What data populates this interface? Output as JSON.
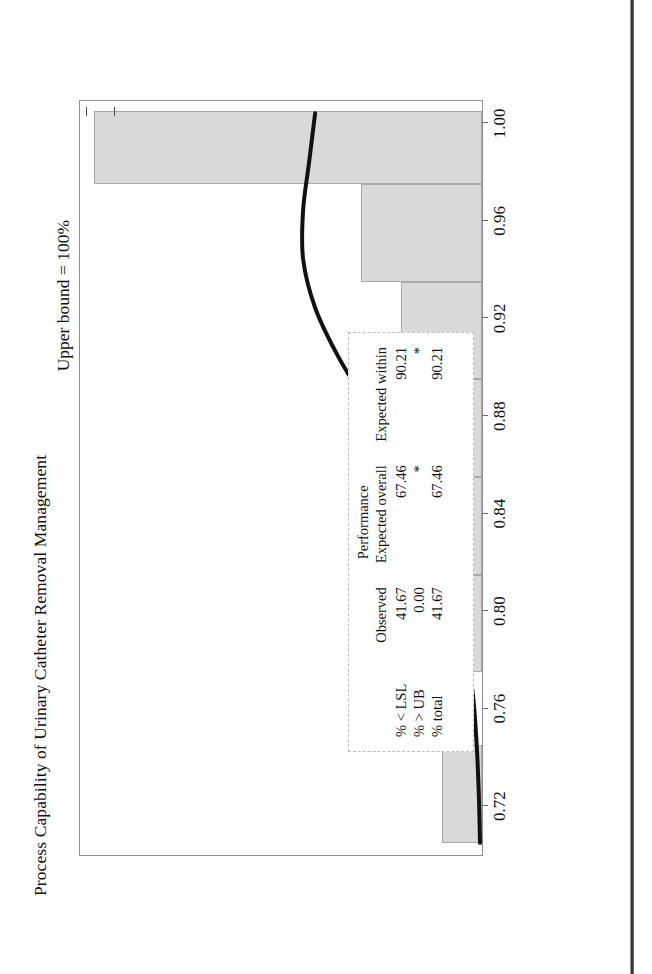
{
  "figure": {
    "title": "Process Capability of Urinary Catheter Removal Management",
    "upper_bound_label": "Upper bound = 100%",
    "lower_spec_label": "Lower spec limit = 99%"
  },
  "table": {
    "group_header": "Performance",
    "columns": [
      "",
      "Observed",
      "Expected overall",
      "Expected within"
    ],
    "rows": [
      {
        "label": "% < LSL",
        "observed": "41.67",
        "expected_overall": "67.46",
        "expected_within": "90.21"
      },
      {
        "label": "% > UB",
        "observed": "0.00",
        "expected_overall": "*",
        "expected_within": "*"
      },
      {
        "label": "% total",
        "observed": "41.67",
        "expected_overall": "67.46",
        "expected_within": "90.21"
      }
    ]
  },
  "chart_data": {
    "type": "bar",
    "title": "Process Capability of Urinary Catheter Removal Management",
    "xlabel": "",
    "ylabel": "",
    "xlim": [
      0.7,
      1.01
    ],
    "ylim": [
      0,
      10
    ],
    "grid": false,
    "legend": null,
    "tick_labels": [
      "0.72",
      "0.76",
      "0.80",
      "0.84",
      "0.88",
      "0.92",
      "0.96",
      "1.00"
    ],
    "tick_values": [
      0.72,
      0.76,
      0.8,
      0.84,
      0.88,
      0.92,
      0.96,
      1.0
    ],
    "bin_edges": [
      0.705,
      0.745,
      0.775,
      0.815,
      0.855,
      0.895,
      0.935,
      0.975,
      1.005
    ],
    "categories": [
      "0.705-0.745",
      "0.745-0.775",
      "0.775-0.815",
      "0.815-0.855",
      "0.855-0.895",
      "0.895-0.935",
      "0.935-0.975",
      "0.975-1.005"
    ],
    "values": [
      1.0,
      0.0,
      1.0,
      1.0,
      1.4,
      2.0,
      3.0,
      9.6
    ],
    "curve": {
      "name": "normal fit",
      "color": "#111111",
      "x": [
        0.705,
        0.725,
        0.745,
        0.765,
        0.785,
        0.805,
        0.825,
        0.845,
        0.865,
        0.885,
        0.905,
        0.925,
        0.945,
        0.965,
        0.985,
        1.005
      ],
      "y": [
        0.05,
        0.08,
        0.13,
        0.22,
        0.38,
        0.62,
        0.98,
        1.48,
        2.12,
        2.85,
        3.58,
        4.15,
        4.45,
        4.45,
        4.3,
        4.15
      ]
    },
    "markers": [
      {
        "name": "upper-bound",
        "label": "Upper bound = 100%",
        "x": 1.0
      },
      {
        "name": "lower-spec-limit",
        "label": "Lower spec limit = 99%",
        "x": 0.99
      }
    ],
    "colors": {
      "bar_fill": "#d9d9d9",
      "bar_edge": "#a8a8a8",
      "curve": "#111111"
    }
  }
}
